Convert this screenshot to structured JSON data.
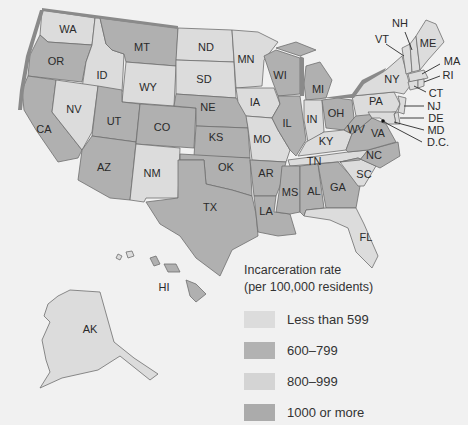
{
  "legend": {
    "title_line1": "Incarceration rate",
    "title_line2": "(per 100,000 residents)",
    "items": [
      {
        "label": "Less than 599",
        "color": "#dcdcdc"
      },
      {
        "label": "600–799",
        "color": "#b2b2b2"
      },
      {
        "label": "800–999",
        "color": "#d4d4d4"
      },
      {
        "label": "1000 or more",
        "color": "#ababab"
      }
    ]
  },
  "colors": {
    "light": "#dcdcdc",
    "mid": "#b0b0b0",
    "water": "#8a8a8a",
    "background": "#f1f1f1"
  },
  "states": {
    "WA": "WA",
    "OR": "OR",
    "CA": "CA",
    "ID": "ID",
    "NV": "NV",
    "MT": "MT",
    "WY": "WY",
    "UT": "UT",
    "AZ": "AZ",
    "CO": "CO",
    "NM": "NM",
    "ND": "ND",
    "SD": "SD",
    "NE": "NE",
    "KS": "KS",
    "OK": "OK",
    "TX": "TX",
    "MN": "MN",
    "IA": "IA",
    "MO": "MO",
    "AR": "AR",
    "LA": "LA",
    "WI": "WI",
    "IL": "IL",
    "MI": "MI",
    "IN": "IN",
    "OH": "OH",
    "KY": "KY",
    "TN": "TN",
    "MS": "MS",
    "AL": "AL",
    "GA": "GA",
    "FL": "FL",
    "SC": "SC",
    "NC": "NC",
    "VA": "VA",
    "WV": "WV",
    "PA": "PA",
    "NY": "NY",
    "VT": "VT",
    "NH": "NH",
    "ME": "ME",
    "MA": "MA",
    "RI": "RI",
    "CT": "CT",
    "NJ": "NJ",
    "DE": "DE",
    "MD": "MD",
    "DC": "D.C.",
    "AK": "AK",
    "HI": "HI"
  }
}
